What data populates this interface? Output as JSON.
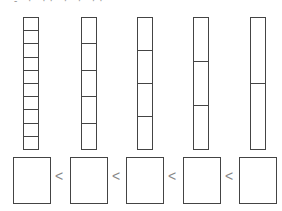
{
  "header": {
    "text_fragment": "- · ·· · · ··"
  },
  "bars": [
    {
      "label": "tenths",
      "segments": 10,
      "x": 23
    },
    {
      "label": "fifths",
      "segments": 5,
      "x": 81
    },
    {
      "label": "fourths",
      "segments": 4,
      "x": 137
    },
    {
      "label": "thirds",
      "segments": 3,
      "x": 193
    },
    {
      "label": "halves",
      "segments": 2,
      "x": 250
    }
  ],
  "answer_boxes": [
    {
      "x": 13,
      "value": ""
    },
    {
      "x": 70,
      "value": ""
    },
    {
      "x": 126,
      "value": ""
    },
    {
      "x": 183,
      "value": ""
    },
    {
      "x": 239,
      "value": ""
    }
  ],
  "comparators": [
    {
      "symbol": "<",
      "x": 55
    },
    {
      "symbol": "<",
      "x": 112
    },
    {
      "symbol": "<",
      "x": 168
    },
    {
      "symbol": "<",
      "x": 225
    }
  ],
  "colors": {
    "stroke": "#444444",
    "comparator": "#888888"
  }
}
